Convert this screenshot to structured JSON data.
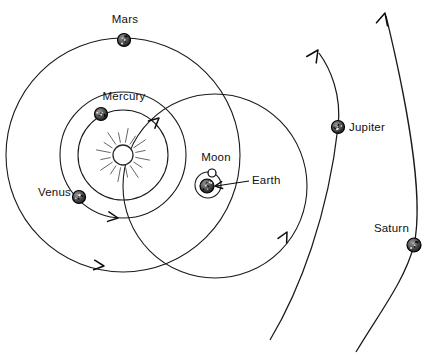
{
  "diagram": {
    "background_color": "#ffffff",
    "stroke_color": "#1a1a1a",
    "width": 441,
    "height": 358
  },
  "sun": {
    "name": "Sun",
    "cx": 123,
    "cy": 155,
    "r": 10,
    "ray_count": 16,
    "ray_inner": 13,
    "ray_outer": 27,
    "color": "#ffffff"
  },
  "labels": {
    "mars": "Mars",
    "mercury": "Mercury",
    "venus": "Venus",
    "moon": "Moon",
    "earth": "Earth",
    "jupiter": "Jupiter",
    "saturn": "Saturn"
  },
  "planets": [
    {
      "key": "mercury",
      "label": "Mercury",
      "cx": 101,
      "cy": 114,
      "r": 6.5,
      "color": "#6b6b6b",
      "label_x": 124,
      "label_y": 100,
      "label_anchor": "middle"
    },
    {
      "key": "venus",
      "label": "Venus",
      "cx": 79,
      "cy": 197,
      "r": 6.5,
      "color": "#4a4a4a",
      "label_x": 71,
      "label_y": 196,
      "label_anchor": "end"
    },
    {
      "key": "mars",
      "label": "Mars",
      "cx": 124,
      "cy": 40,
      "r": 6.5,
      "color": "#3d3d3d",
      "label_x": 125,
      "label_y": 23,
      "label_anchor": "middle"
    },
    {
      "key": "earth",
      "label": "Earth",
      "cx": 207,
      "cy": 186,
      "r": 7,
      "color": "#4a4a4a",
      "label_x": 252,
      "label_y": 184,
      "label_anchor": "start"
    },
    {
      "key": "jupiter",
      "label": "Jupiter",
      "cx": 338,
      "cy": 127,
      "r": 6.5,
      "color": "#4a4a4a",
      "label_x": 349,
      "label_y": 131,
      "label_anchor": "start"
    },
    {
      "key": "saturn",
      "label": "Saturn",
      "cx": 414,
      "cy": 245,
      "r": 7,
      "color": "#4a4a4a",
      "label_x": 409,
      "label_y": 232,
      "label_anchor": "end"
    }
  ],
  "moon": {
    "key": "moon",
    "label": "Moon",
    "cx": 212,
    "cy": 173,
    "r": 4,
    "orbit_cx": 208,
    "orbit_cy": 185,
    "orbit_r": 13,
    "label_x": 216,
    "label_y": 161,
    "label_anchor": "middle"
  },
  "orbits": [
    {
      "key": "mercury-orbit",
      "label": "Mercury orbit",
      "cx": 123,
      "cy": 155,
      "r": 45
    },
    {
      "key": "venus-orbit",
      "label": "Venus orbit",
      "cx": 123,
      "cy": 155,
      "r": 63
    },
    {
      "key": "earth-orbit",
      "label": "Earth orbit",
      "cx": 215,
      "cy": 186,
      "r": 92
    },
    {
      "key": "mars-orbit",
      "label": "Mars orbit",
      "cx": 123,
      "cy": 155,
      "r": 117
    }
  ],
  "outer_orbits": [
    {
      "key": "jupiter-orbit",
      "label": "Jupiter orbit",
      "path": "M 270 340 C 300 290, 328 215, 338 127 C 342 95, 330 68, 319 53",
      "arrow": {
        "tip_x": 318,
        "tip_y": 50,
        "angle": -56
      }
    },
    {
      "key": "saturn-orbit",
      "label": "Saturn orbit",
      "path": "M 356 352 C 380 312, 405 280, 414 245 C 425 195, 404 90, 386 16",
      "arrow": {
        "tip_x": 385,
        "tip_y": 13,
        "angle": -75
      }
    }
  ],
  "orbit_arrows": [
    {
      "key": "mercury-orbit-arrow",
      "label": "Mercury direction arrow",
      "tip_x": 159,
      "tip_y": 118,
      "angle": -42
    },
    {
      "key": "venus-orbit-arrow",
      "label": "Venus direction arrow",
      "tip_x": 118,
      "tip_y": 218,
      "angle": 8
    },
    {
      "key": "earth-orbit-arrow",
      "label": "Earth direction arrow",
      "tip_x": 287,
      "tip_y": 232,
      "angle": -62
    },
    {
      "key": "mars-orbit-arrow",
      "label": "Mars direction arrow",
      "tip_x": 104,
      "tip_y": 266,
      "angle": 6
    }
  ],
  "earth_leader": {
    "label": "Earth leader line",
    "x1": 249,
    "y1": 181,
    "x2": 216,
    "y2": 186,
    "arrow_tip_x": 215,
    "arrow_tip_y": 186,
    "arrow_angle": 172
  }
}
